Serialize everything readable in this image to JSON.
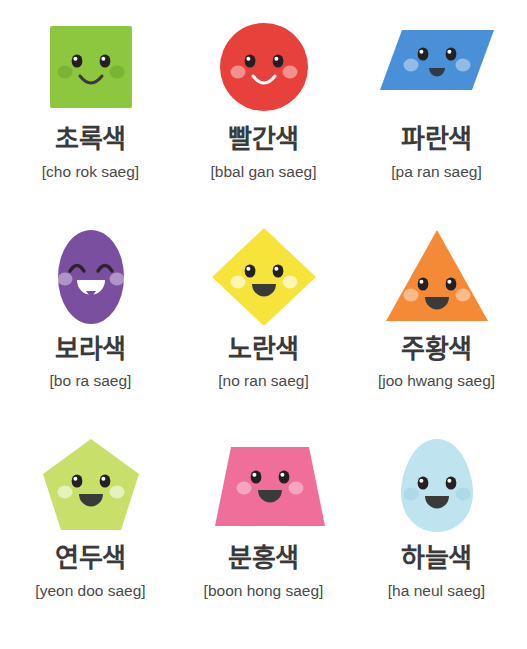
{
  "sheet": {
    "title": "Korean Color Words Flashcard Sheet",
    "background": "#ffffff",
    "columns": 3,
    "rows": 3
  },
  "cards": [
    {
      "id": "cho-rok-saeg",
      "korean": "초록색",
      "romanization": "[cho rok saeg]",
      "color_name_en": "green",
      "shape": "square",
      "fill": "#8dc63f",
      "cheek": "#6aa62c",
      "cheek_opacity": 0.55,
      "mouth_style": "smile-line",
      "mouth_color": "#3a3a3a",
      "eye_style": "open"
    },
    {
      "id": "bbal-gan-saeg",
      "korean": "빨간색",
      "romanization": "[bbal gan saeg]",
      "color_name_en": "red",
      "shape": "circle",
      "fill": "#e8413c",
      "cheek": "#ffffff",
      "cheek_opacity": 0.42,
      "mouth_style": "smile-line-light",
      "mouth_color": "#ffffff",
      "eye_style": "open"
    },
    {
      "id": "pa-ran-saeg",
      "korean": "파란색",
      "romanization": "[pa ran saeg]",
      "color_name_en": "blue",
      "shape": "parallelogram",
      "fill": "#4a90d9",
      "cheek": "#ffffff",
      "cheek_opacity": 0.4,
      "mouth_style": "mouth-open-small",
      "mouth_color": "#2f3a45",
      "eye_style": "open"
    },
    {
      "id": "bo-ra-saeg",
      "korean": "보라색",
      "romanization": "[bo ra saeg]",
      "color_name_en": "purple",
      "shape": "ellipse",
      "fill": "#7b4fa0",
      "cheek": "#ffffff",
      "cheek_opacity": 0.4,
      "mouth_style": "mouth-teeth",
      "mouth_color": "#ffffff",
      "eye_style": "closed-arc"
    },
    {
      "id": "no-ran-saeg",
      "korean": "노란색",
      "romanization": "[no ran saeg]",
      "color_name_en": "yellow",
      "shape": "diamond",
      "fill": "#f6e43a",
      "cheek": "#ffffff",
      "cheek_opacity": 0.62,
      "mouth_style": "mouth-open-big",
      "mouth_color": "#3a3a3a",
      "eye_style": "open"
    },
    {
      "id": "joo-hwang-saeg",
      "korean": "주황색",
      "romanization": "[joo hwang saeg]",
      "color_name_en": "orange",
      "shape": "triangle",
      "fill": "#f58a36",
      "cheek": "#ffffff",
      "cheek_opacity": 0.42,
      "mouth_style": "mouth-open-big",
      "mouth_color": "#3a3a3a",
      "eye_style": "open"
    },
    {
      "id": "yeon-doo-saeg",
      "korean": "연두색",
      "romanization": "[yeon doo saeg]",
      "color_name_en": "light green",
      "shape": "pentagon",
      "fill": "#c8e06a",
      "cheek": "#ffffff",
      "cheek_opacity": 0.55,
      "mouth_style": "mouth-open-big",
      "mouth_color": "#3a3a3a",
      "eye_style": "open"
    },
    {
      "id": "boon-hong-saeg",
      "korean": "분홍색",
      "romanization": "[boon hong saeg]",
      "color_name_en": "pink",
      "shape": "trapezoid",
      "fill": "#ef6f9a",
      "cheek": "#ffffff",
      "cheek_opacity": 0.38,
      "mouth_style": "mouth-open-big",
      "mouth_color": "#3a3a3a",
      "eye_style": "open"
    },
    {
      "id": "ha-neul-saeg",
      "korean": "하늘색",
      "romanization": "[ha neul saeg]",
      "color_name_en": "sky blue",
      "shape": "egg",
      "fill": "#bfe3ef",
      "cheek": "#9fd2e3",
      "cheek_opacity": 0.55,
      "mouth_style": "mouth-open-big",
      "mouth_color": "#3a3a3a",
      "eye_style": "open"
    }
  ]
}
